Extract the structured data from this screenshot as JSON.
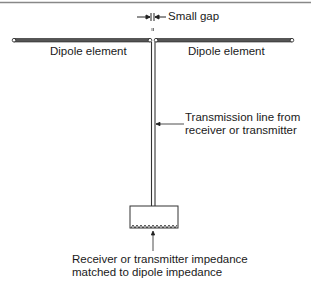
{
  "diagram": {
    "labels": {
      "small_gap": "Small gap",
      "dipole_left": "Dipole element",
      "dipole_right": "Dipole element",
      "transmission_line_1": "Transmission line from",
      "transmission_line_2": "receiver or transmitter",
      "impedance_1": "Receiver or transmitter impedance",
      "impedance_2": "matched to dipole impedance"
    },
    "colors": {
      "line": "#333333",
      "rod_fill": "#555555",
      "border": "#888888"
    }
  }
}
